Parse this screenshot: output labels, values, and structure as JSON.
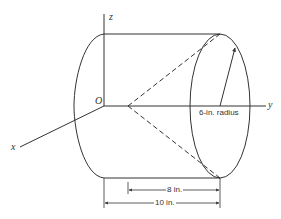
{
  "diagram": {
    "type": "engineering-drawing",
    "axes": {
      "z_label": "z",
      "y_label": "y",
      "x_label": "x",
      "origin_label": "O"
    },
    "annotations": {
      "radius": "6-in. radius",
      "inner_length": "8 in.",
      "outer_length": "10 in."
    },
    "colors": {
      "line": "#333333",
      "background": "#ffffff"
    }
  }
}
